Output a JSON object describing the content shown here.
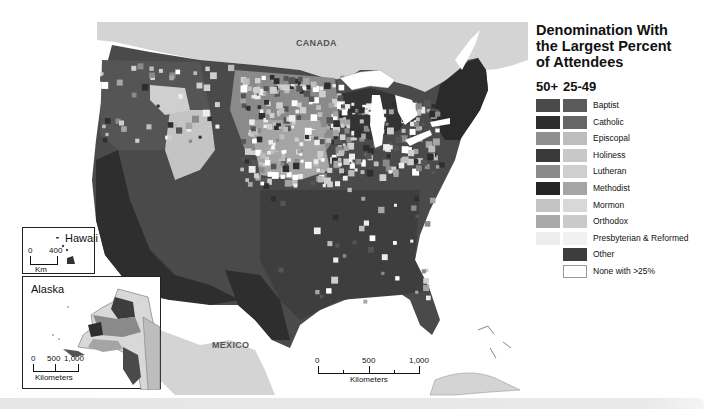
{
  "map": {
    "title_lines": [
      "Denomination With",
      "the Largest Percent",
      "of Attendees"
    ],
    "country_labels": {
      "canada": "CANADA",
      "mexico": "MEXICO"
    },
    "main_scale": {
      "ticks": [
        "0",
        "500",
        "1,000"
      ],
      "unit": "Kilometers"
    },
    "hawaii_inset": {
      "title": "Hawaii",
      "scale_ticks": [
        "0",
        "400"
      ],
      "unit": "Km"
    },
    "alaska_inset": {
      "title": "Alaska",
      "scale_ticks": [
        "0",
        "500",
        "1,000"
      ],
      "unit": "Kilometers"
    }
  },
  "legend": {
    "column_headers": [
      "50+",
      "25-49"
    ],
    "items": [
      {
        "label": "Baptist",
        "color_50plus": "#4a4a4a",
        "color_25_49": "#5a5a5a"
      },
      {
        "label": "Catholic",
        "color_50plus": "#2e2e2e",
        "color_25_49": "#666666"
      },
      {
        "label": "Episcopal",
        "color_50plus": "#8f8f8f",
        "color_25_49": "#bdbdbd"
      },
      {
        "label": "Holiness",
        "color_50plus": "#3a3a3a",
        "color_25_49": "#c8c8c8"
      },
      {
        "label": "Lutheran",
        "color_50plus": "#8a8a8a",
        "color_25_49": "#cfcfcf"
      },
      {
        "label": "Methodist",
        "color_50plus": "#242424",
        "color_25_49": "#a5a5a5"
      },
      {
        "label": "Mormon",
        "color_50plus": "#c4c4c4",
        "color_25_49": "#d8d8d8"
      },
      {
        "label": "Orthodox",
        "color_50plus": "#a9a9a9",
        "color_25_49": "#cacaca"
      },
      {
        "label": "Presbyterian & Reformed",
        "color_50plus": "#ededed",
        "color_25_49": "#f1f1f1"
      },
      {
        "label": "Other",
        "color_50plus": null,
        "color_25_49": "#3d3d3d"
      },
      {
        "label": "None with >25%",
        "color_50plus": null,
        "color_25_49": "#ffffff"
      }
    ]
  },
  "colors": {
    "foreign_land": "#d4d4d4",
    "water": "#ffffff",
    "outline": "#444444"
  }
}
